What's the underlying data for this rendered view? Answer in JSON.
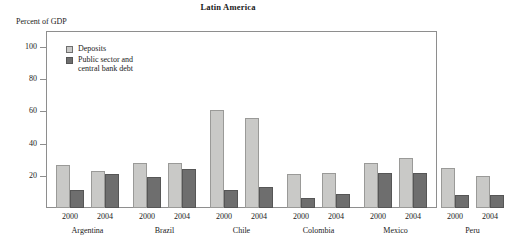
{
  "chart_data": {
    "type": "bar",
    "title": "Latin America",
    "ylabel": "Percent of GDP",
    "xlabel": "",
    "ylim": [
      0,
      110
    ],
    "yticks": [
      20,
      40,
      60,
      80,
      100
    ],
    "grid": false,
    "legend_position": "top-left",
    "categories": [
      "Argentina 2000",
      "Argentina 2004",
      "Brazil 2000",
      "Brazil 2004",
      "Chile 2000",
      "Chile 2004",
      "Colombia 2000",
      "Colombia 2004",
      "Mexico 2000",
      "Mexico 2004",
      "Peru 2000",
      "Peru 2004"
    ],
    "countries": [
      "Argentina",
      "Brazil",
      "Chile",
      "Colombia",
      "Mexico",
      "Peru"
    ],
    "years": [
      "2000",
      "2004"
    ],
    "series": [
      {
        "name": "Deposits",
        "color": "#c9c9c7",
        "values": [
          27,
          23,
          28,
          28,
          61,
          56,
          21,
          22,
          28,
          31,
          25,
          20
        ]
      },
      {
        "name": "Public sector and\ncentral bank debt",
        "color": "#6e6e6e",
        "values": [
          11,
          21,
          19,
          24,
          11,
          13,
          6,
          9,
          22,
          22,
          8,
          8
        ]
      }
    ]
  },
  "legend": {
    "items": [
      {
        "label": "Deposits",
        "swatch": "light"
      },
      {
        "label": "Public sector and\n     central bank debt",
        "swatch": "dark"
      }
    ]
  },
  "axis": {
    "unit_label": "Percent of GDP",
    "y_tick_labels": [
      "100",
      "80",
      "60",
      "40",
      "20"
    ]
  }
}
